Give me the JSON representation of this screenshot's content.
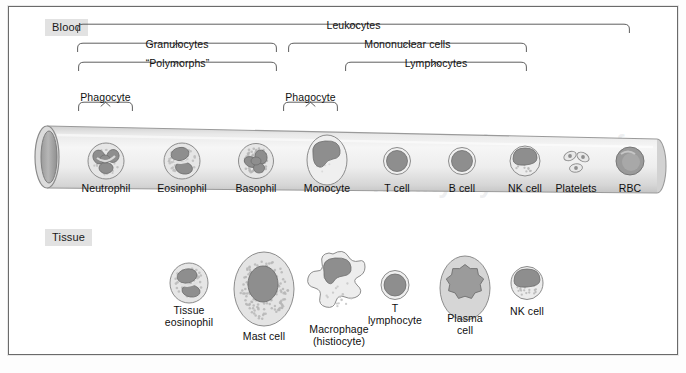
{
  "figure": {
    "sections": [
      {
        "key": "blood",
        "label": "Blood",
        "x": 44,
        "y": 18
      },
      {
        "key": "tissue",
        "label": "Tissue",
        "x": 44,
        "y": 228
      }
    ],
    "brackets": [
      {
        "name": "leukocytes",
        "label": "Leukocytes",
        "x1": 77,
        "x2": 630,
        "y": 32,
        "label_y": 19
      },
      {
        "name": "granulocytes",
        "label": "Granulocytes",
        "x1": 77,
        "x2": 277,
        "y": 51,
        "label_y": 38
      },
      {
        "name": "mononuclear-cells",
        "label": "Mononuclear cells",
        "x1": 288,
        "x2": 527,
        "y": 51,
        "label_y": 38
      },
      {
        "name": "polymorphs",
        "label": "“Polymorphs”",
        "x1": 78,
        "x2": 277,
        "y": 70,
        "label_y": 57
      },
      {
        "name": "lymphocytes",
        "label": "Lymphocytes",
        "x1": 345,
        "x2": 527,
        "y": 70,
        "label_y": 57
      },
      {
        "name": "phagocyte-left",
        "label": "Phagocyte",
        "x1": 78,
        "x2": 133,
        "y": 110,
        "label_y": 91
      },
      {
        "name": "phagocyte-right",
        "label": "Phagocyte",
        "x1": 283,
        "x2": 338,
        "y": 110,
        "label_y": 91
      }
    ],
    "blood_cells": [
      {
        "name": "neutrophil",
        "label": "Neutrophil",
        "cx": 106,
        "cy": 161,
        "label_y": 183
      },
      {
        "name": "eosinophil",
        "label": "Eosinophil",
        "cx": 182,
        "cy": 161,
        "label_y": 183
      },
      {
        "name": "basophil",
        "label": "Basophil",
        "cx": 256,
        "cy": 161,
        "label_y": 183
      },
      {
        "name": "monocyte",
        "label": "Monocyte",
        "cx": 327,
        "cy": 160,
        "label_y": 183
      },
      {
        "name": "t-cell",
        "label": "T cell",
        "cx": 397,
        "cy": 161,
        "label_y": 183
      },
      {
        "name": "b-cell",
        "label": "B cell",
        "cx": 462,
        "cy": 161,
        "label_y": 183
      },
      {
        "name": "nk-cell",
        "label": "NK cell",
        "cx": 525,
        "cy": 161,
        "label_y": 183
      },
      {
        "name": "platelets",
        "label": "Platelets",
        "cx": 576,
        "cy": 161,
        "label_y": 183
      },
      {
        "name": "rbc",
        "label": "RBC",
        "cx": 630,
        "cy": 161,
        "label_y": 183
      }
    ],
    "tissue_cells": [
      {
        "name": "tissue-eosinophil",
        "label": "Tissue\neosinophil",
        "cx": 189,
        "cy": 283,
        "label_y": 305
      },
      {
        "name": "mast-cell",
        "label": "Mast cell",
        "cx": 264,
        "cy": 289,
        "label_y": 331
      },
      {
        "name": "macrophage",
        "label": "Macrophage\n(histiocyte)",
        "cx": 339,
        "cy": 288,
        "label_y": 324
      },
      {
        "name": "t-lymphocyte",
        "label": "T\nlymphocyte",
        "cx": 395,
        "cy": 285,
        "label_y": 303
      },
      {
        "name": "plasma-cell",
        "label": "Plasma\ncell",
        "cx": 465,
        "cy": 288,
        "label_y": 313
      },
      {
        "name": "nk-cell-tissue",
        "label": "NK cell",
        "cx": 527,
        "cy": 283,
        "label_y": 306
      }
    ],
    "colors": {
      "frame_border": "#6a6a6a",
      "section_tag_bg": "#e2e2e2",
      "vessel_fill": "#d8d8d8",
      "vessel_stroke": "#8d8d8d",
      "cytoplasm": "#e6e6e6",
      "nucleus": "#8e8e8e",
      "granule": "#b9b9b9",
      "text": "#111111"
    },
    "watermarks": [
      {
        "text": "…s and Organs of",
        "x": 392,
        "y": 130,
        "size": 27
      },
      {
        "text": "nunity System",
        "x": 372,
        "y": 168,
        "size": 27
      }
    ]
  }
}
